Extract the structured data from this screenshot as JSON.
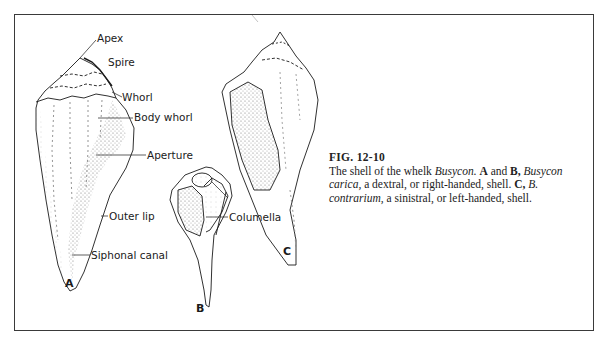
{
  "figure": {
    "number": "FIG. 12-10",
    "caption_parts": {
      "p1": "The shell of the whelk ",
      "genus": "Busycon.",
      "p2": " ",
      "a": "A",
      "p3": " and ",
      "b": "B,",
      "p4": " ",
      "species1": "Busycon carica,",
      "p5": " a dextral, or right-handed, shell. ",
      "c": "C,",
      "p6": " ",
      "species2": "B. contrarium,",
      "p7": " a sinistral, or left-handed, shell."
    }
  },
  "labels": {
    "apex": "Apex",
    "spire": "Spire",
    "whorl": "Whorl",
    "body_whorl": "Body whorl",
    "aperture": "Aperture",
    "outer_lip": "Outer lip",
    "siphonal_canal": "Siphonal canal",
    "columella": "Columella"
  },
  "panels": {
    "a": "A",
    "b": "B",
    "c": "C"
  },
  "colors": {
    "ink": "#1a1a1a",
    "stipple": "#9a9a9a",
    "frame": "#3a3a3a"
  }
}
